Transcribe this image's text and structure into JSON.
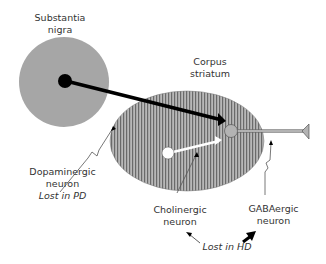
{
  "labels": {
    "substantia_nigra": [
      "Substantia",
      "nigra"
    ],
    "corpus_striatum": [
      "Corpus",
      "striatum"
    ],
    "dopaminergic": [
      "Dopaminergic",
      "neuron"
    ],
    "lost_in_pd": "Lost in PD",
    "cholinergic": [
      "Cholinergic",
      "neuron"
    ],
    "gabaergic": [
      "GABAergic",
      "neuron"
    ],
    "lost_in_hd": "Lost in HD"
  },
  "colors": {
    "nigra_fill": "#a6a6a6",
    "striatum_fill": "#9a9a9a",
    "neuron_black": "#000000",
    "gaba_neuron": "#b3b3b3",
    "text": "#333333"
  }
}
